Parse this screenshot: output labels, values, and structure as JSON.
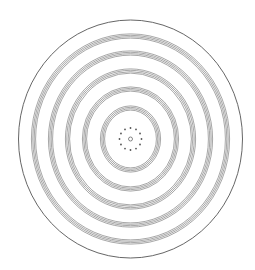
{
  "diagram": {
    "title": "",
    "center": {
      "x": 130.5,
      "y": 139
    },
    "stroke_color": "#6b6b6b",
    "outer_stroke_color": "#555555",
    "dot_color": "#555555",
    "outer_ellipse": {
      "rx": 112,
      "ry": 119
    },
    "ring_groups": [
      {
        "rx": 97,
        "ry": 103
      },
      {
        "rx": 80,
        "ry": 86
      },
      {
        "rx": 63,
        "ry": 68
      },
      {
        "rx": 46,
        "ry": 50
      },
      {
        "rx": 28,
        "ry": 31
      }
    ],
    "lines_per_group": 4,
    "line_spacing": 1.4,
    "dot_ring": {
      "radius": 11,
      "count": 12,
      "dot_r": 0.9
    },
    "center_circle": {
      "r": 2
    }
  }
}
